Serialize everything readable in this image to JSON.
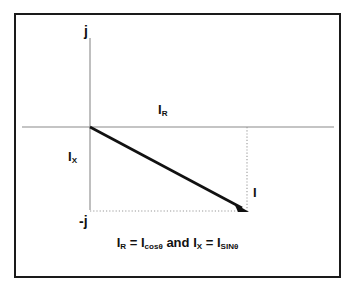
{
  "figure": {
    "border_color": "#1a1a1a",
    "background_color": "#ffffff",
    "axis_color": "#8a8a8a",
    "vector_color": "#111111",
    "dotted_color": "#9a9a9a"
  },
  "axes": {
    "vertical_top_label": "j",
    "vertical_bottom_label": "-j",
    "origin": {
      "x": 90,
      "y": 127
    },
    "vertical": {
      "x": 90,
      "y_top": 38,
      "y_bottom": 210
    },
    "horizontal": {
      "y": 127,
      "x_left": 22,
      "x_right": 334
    }
  },
  "labels": {
    "resistive": {
      "symbol": "I",
      "subscript": "R"
    },
    "reactive": {
      "symbol": "I",
      "subscript": "X"
    },
    "total": {
      "symbol": "I",
      "subscript": ""
    }
  },
  "vector": {
    "name": "I",
    "start": {
      "x": 90,
      "y": 127
    },
    "end": {
      "x": 247,
      "y": 211
    },
    "arrowhead": true,
    "stroke_width": 2.6
  },
  "projections": {
    "horizontal_dotted": {
      "x1": 90,
      "y1": 211,
      "x2": 247,
      "y2": 211
    },
    "vertical_dotted": {
      "x1": 247,
      "y1": 127,
      "x2": 247,
      "y2": 211
    }
  },
  "caption": {
    "left": {
      "lhs_symbol": "I",
      "lhs_sub": "R",
      "equals": "=",
      "rhs_symbol": "I",
      "rhs_sub": "cosθ"
    },
    "conjunction": "and",
    "right": {
      "lhs_symbol": "I",
      "lhs_sub": "X",
      "equals": "=",
      "rhs_symbol": "I",
      "rhs_sub": "SINθ"
    },
    "full_text": "IR = Icosθ and IX = ISINθ"
  }
}
